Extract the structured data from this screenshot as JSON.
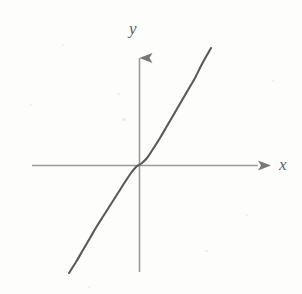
{
  "figure": {
    "background_color": "#fdfdfc",
    "width": 302,
    "height": 294,
    "axis_color": "#9a9a98",
    "curve_color": "#5a5a58",
    "label_color": "#5f5f5d"
  },
  "labels": {
    "x_axis": "x",
    "y_axis": "y"
  },
  "chart_data": {
    "type": "line",
    "title": "",
    "subtitle": "",
    "xlabel": "x",
    "ylabel": "y",
    "function": "y = x^3",
    "grid": false,
    "legend": null,
    "axes": {
      "x_axis_pixel_y": 165,
      "y_axis_pixel_x": 139,
      "x_axis_from_pixel_x": 32,
      "x_axis_to_pixel_x": 270,
      "y_axis_from_pixel_y": 272,
      "y_axis_to_pixel_y": 45,
      "x_arrow": "right",
      "y_arrow": "up",
      "origin_pixel": [
        139,
        165
      ],
      "ticks": [],
      "tick_labels": []
    },
    "xlim": [
      -1.32,
      1.32
    ],
    "ylim": [
      -2.3,
      2.5
    ],
    "x": [
      -1.32,
      -1.2,
      -1.1,
      -1.0,
      -0.9,
      -0.8,
      -0.7,
      -0.6,
      -0.5,
      -0.4,
      -0.3,
      -0.2,
      -0.1,
      0.0,
      0.1,
      0.2,
      0.3,
      0.4,
      0.5,
      0.6,
      0.7,
      0.8,
      0.9,
      1.0,
      1.1,
      1.2,
      1.32
    ],
    "values": [
      -2.3,
      -1.73,
      -1.33,
      -1.0,
      -0.73,
      -0.51,
      -0.34,
      -0.22,
      -0.13,
      -0.06,
      -0.03,
      -0.01,
      0.0,
      0.0,
      0.0,
      0.01,
      0.03,
      0.06,
      0.13,
      0.22,
      0.34,
      0.51,
      0.73,
      1.0,
      1.33,
      1.73,
      2.3
    ],
    "curve_pixel_path": [
      [
        69,
        273
      ],
      [
        76,
        262
      ],
      [
        83,
        250
      ],
      [
        90,
        238
      ],
      [
        97,
        226
      ],
      [
        104,
        215
      ],
      [
        111,
        204
      ],
      [
        118,
        193
      ],
      [
        125,
        182
      ],
      [
        131,
        173
      ],
      [
        136,
        167
      ],
      [
        139,
        165
      ],
      [
        142,
        163
      ],
      [
        147,
        158
      ],
      [
        153,
        149
      ],
      [
        160,
        138
      ],
      [
        167,
        126
      ],
      [
        174,
        114
      ],
      [
        181,
        102
      ],
      [
        188,
        90
      ],
      [
        195,
        78
      ],
      [
        202,
        64
      ],
      [
        211,
        48
      ]
    ],
    "curve_endpoints": {
      "lower_left_pixel": [
        69,
        273
      ],
      "upper_right_pixel": [
        211,
        48
      ]
    },
    "annotations": []
  },
  "specks": [
    {
      "x": 117,
      "y": 93,
      "w": 3,
      "h": 2
    },
    {
      "x": 122,
      "y": 118,
      "w": 4,
      "h": 3
    },
    {
      "x": 30,
      "y": 104,
      "w": 2,
      "h": 2
    },
    {
      "x": 246,
      "y": 214,
      "w": 2,
      "h": 2
    },
    {
      "x": 62,
      "y": 44,
      "w": 2,
      "h": 2
    },
    {
      "x": 205,
      "y": 250,
      "w": 3,
      "h": 2
    },
    {
      "x": 272,
      "y": 80,
      "w": 2,
      "h": 2
    },
    {
      "x": 88,
      "y": 286,
      "w": 2,
      "h": 2
    }
  ]
}
